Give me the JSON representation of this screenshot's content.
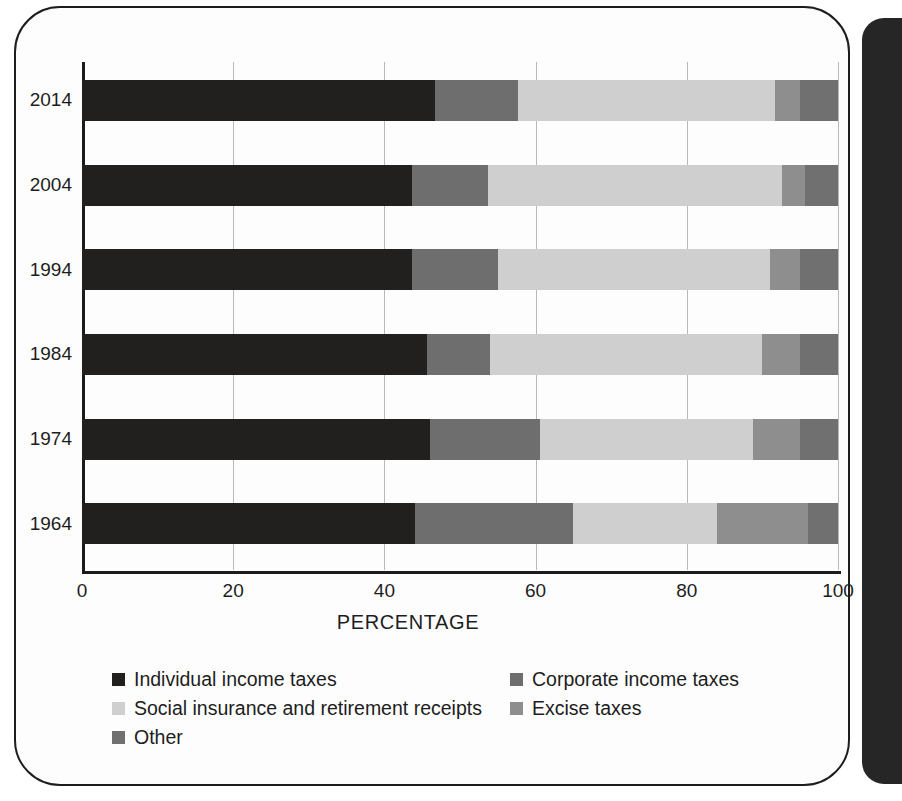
{
  "chart_data": {
    "type": "bar",
    "orientation": "horizontal",
    "stacked": true,
    "title": "",
    "xlabel": "PERCENTAGE",
    "ylabel": "",
    "xlim": [
      0,
      100
    ],
    "xticks": [
      0,
      20,
      40,
      60,
      80,
      100
    ],
    "xtick_labels": [
      "0",
      "20",
      "40",
      "60",
      "80",
      "100"
    ],
    "categories": [
      "2014",
      "2004",
      "1994",
      "1984",
      "1974",
      "1964"
    ],
    "grid": true,
    "legend_position": "bottom",
    "series": [
      {
        "name": "Individual income taxes",
        "color": "#221f1f",
        "values": [
          46.7,
          43.7,
          43.7,
          45.6,
          46.0,
          44.0
        ]
      },
      {
        "name": "Corporate income taxes",
        "color": "#6e6e6e",
        "values": [
          11.0,
          10.0,
          11.3,
          8.4,
          14.6,
          21.0
        ]
      },
      {
        "name": "Social insurance and retirement receipts",
        "color": "#cfcfcf",
        "values": [
          34.0,
          38.9,
          36.0,
          36.0,
          28.2,
          19.0
        ]
      },
      {
        "name": "Excise taxes",
        "color": "#8e8e8e",
        "values": [
          3.3,
          3.0,
          4.0,
          5.0,
          6.2,
          12.0
        ]
      },
      {
        "name": "Other",
        "color": "#707070",
        "values": [
          5.0,
          4.4,
          5.0,
          5.0,
          5.0,
          4.0
        ]
      }
    ]
  },
  "axis": {
    "x_title": "PERCENTAGE",
    "ticks": [
      "0",
      "20",
      "40",
      "60",
      "80",
      "100"
    ],
    "year_labels": [
      "2014",
      "2004",
      "1994",
      "1984",
      "1974",
      "1964"
    ]
  },
  "legend": {
    "rows": [
      {
        "left": {
          "label": "Individual income taxes",
          "color": "#221f1f"
        },
        "right": {
          "label": "Corporate income taxes",
          "color": "#6e6e6e"
        }
      },
      {
        "left": {
          "label": "Social insurance and retirement receipts",
          "color": "#cfcfcf"
        },
        "right": {
          "label": "Excise taxes",
          "color": "#8e8e8e"
        }
      },
      {
        "left": {
          "label": "Other",
          "color": "#707070"
        },
        "right": null
      }
    ]
  },
  "colors": {
    "individual": "#221f1f",
    "corporate": "#6e6e6e",
    "social": "#cfcfcf",
    "excise": "#8e8e8e",
    "other": "#707070",
    "axis": "#1b1b1b",
    "grid": "#b9b9b9",
    "page_border": "#1d1d1d",
    "right_panel": "#262626"
  }
}
